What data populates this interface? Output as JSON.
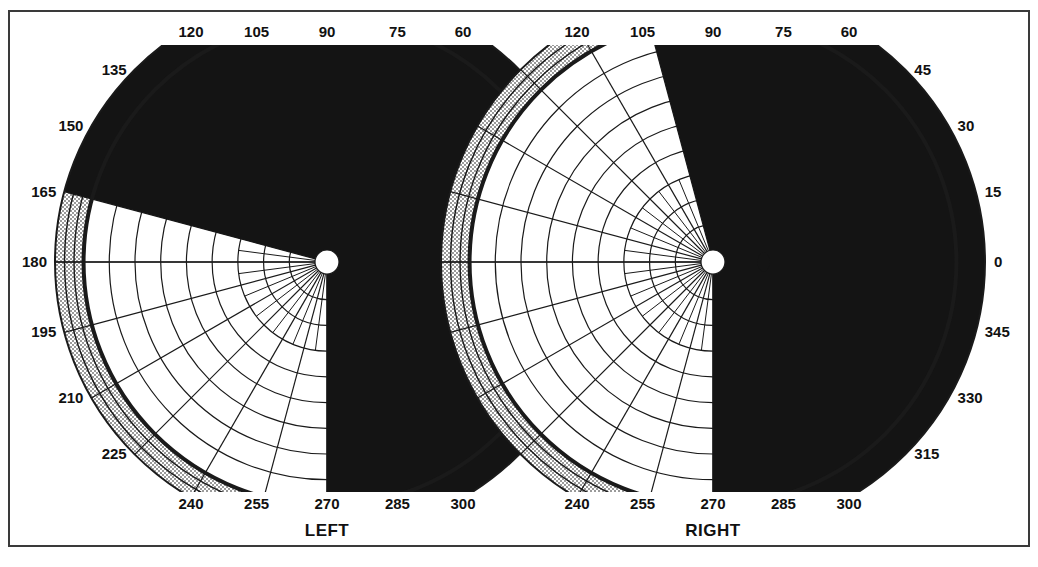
{
  "figure": {
    "title": "",
    "border_color": "#3a3a3a",
    "background": "#ffffff"
  },
  "chart_data": {
    "type": "line",
    "subtype": "polar-perimetry",
    "xlabel": "",
    "ylabel": "",
    "grid": true,
    "legend_position": "none",
    "angular_unit": "degrees",
    "angular_step": 15,
    "radial_rings": [
      10,
      20,
      30,
      40,
      50,
      60,
      70,
      80,
      90
    ],
    "radial_max": 90,
    "colors": {
      "grid": "#1a1a1a",
      "stipple": "#b8b8b8",
      "scotoma": "#141414",
      "field": "#ffffff",
      "text": "#111111"
    },
    "panels": [
      {
        "name": "left-eye",
        "label": "LEFT",
        "center_px": [
          327,
          262
        ],
        "radius_px": 272,
        "tick_labels_top": [
          "120",
          "105",
          "90",
          "75",
          "60"
        ],
        "tick_labels_left": [
          "135",
          "150",
          "165",
          "180",
          "195",
          "210",
          "225"
        ],
        "tick_labels_bottom": [
          "240",
          "255",
          "270",
          "285",
          "300"
        ],
        "tick_labels_right": [],
        "isopter_outer_deg": 90,
        "scotoma": {
          "description": "dense inferonasal defect respecting horizontal midline",
          "start_angle_deg": 165,
          "end_angle_deg": 270,
          "extends_to_periphery": true
        },
        "blind_spot": null
      },
      {
        "name": "right-eye",
        "label": "RIGHT",
        "center_px": [
          713,
          262
        ],
        "radius_px": 272,
        "tick_labels_top": [
          "120",
          "105",
          "90",
          "75",
          "60"
        ],
        "tick_labels_left": [],
        "tick_labels_bottom": [
          "240",
          "255",
          "270",
          "285",
          "300"
        ],
        "tick_labels_right": [
          "45",
          "30",
          "15",
          "0",
          "345",
          "330",
          "315"
        ],
        "isopter_outer_deg": 90,
        "scotoma": {
          "description": "dense temporal/inferior defect respecting vertical midline",
          "start_angle_deg": 105,
          "end_angle_deg": 270,
          "extends_to_periphery": true
        },
        "blind_spot": {
          "angle_deg": 0,
          "eccentricity_deg": 15,
          "present": true
        }
      }
    ]
  },
  "labels": {
    "left_eye": "LEFT",
    "right_eye": "RIGHT",
    "ticks": {
      "t0": "0",
      "t15": "15",
      "t30": "30",
      "t45": "45",
      "t60": "60",
      "t75": "75",
      "t90": "90",
      "t105": "105",
      "t120": "120",
      "t135": "135",
      "t150": "150",
      "t165": "165",
      "t180": "180",
      "t195": "195",
      "t210": "210",
      "t225": "225",
      "t240": "240",
      "t255": "255",
      "t270": "270",
      "t285": "285",
      "t300": "300",
      "t315": "315",
      "t330": "330",
      "t345": "345"
    }
  }
}
